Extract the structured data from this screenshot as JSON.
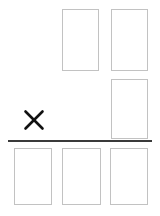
{
  "worksheet": {
    "title": "Multiplication partial-products worksheet",
    "canvas": {
      "width": 160,
      "height": 216
    },
    "background_color": "#ffffff",
    "box_border_color": "#c2c2c2",
    "box_fill_color": "#ffffff",
    "box_border_width": 1.5,
    "rule_color": "#3a3a3a",
    "operator_color": "#111111"
  },
  "operator": {
    "symbol": "×",
    "name": "multiplication-sign",
    "x": 24,
    "y": 110,
    "width": 20,
    "height": 20
  },
  "rule": {
    "name": "answer-rule",
    "x": 8,
    "y": 140,
    "width": 144,
    "height": 2
  },
  "rows": [
    {
      "name": "multiplicand-row",
      "label": "Top row",
      "boxes": [
        {
          "name": "digit-box",
          "value": "",
          "x": 62,
          "y": 9,
          "width": 37,
          "height": 62
        },
        {
          "name": "digit-box",
          "value": "",
          "x": 111,
          "y": 9,
          "width": 37,
          "height": 62
        }
      ]
    },
    {
      "name": "multiplier-row",
      "label": "Middle row",
      "boxes": [
        {
          "name": "digit-box",
          "value": "",
          "x": 111,
          "y": 79,
          "width": 37,
          "height": 60
        }
      ]
    },
    {
      "name": "product-row",
      "label": "Bottom row",
      "boxes": [
        {
          "name": "digit-box",
          "value": "",
          "x": 14,
          "y": 148,
          "width": 38,
          "height": 57
        },
        {
          "name": "digit-box",
          "value": "",
          "x": 62,
          "y": 148,
          "width": 39,
          "height": 57
        },
        {
          "name": "digit-box",
          "value": "",
          "x": 110,
          "y": 148,
          "width": 38,
          "height": 57
        }
      ]
    }
  ]
}
